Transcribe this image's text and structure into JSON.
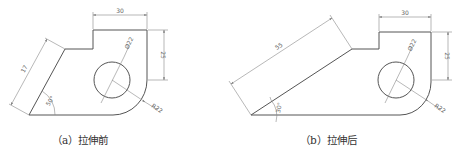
{
  "figures": [
    {
      "id": "a",
      "caption": "（a）拉伸前",
      "dimensions": {
        "top_width": "30",
        "right_height": "25",
        "slant_length": "17",
        "angle": "50°",
        "hole_diameter": "Ø22",
        "fillet_radius": "R22"
      }
    },
    {
      "id": "b",
      "caption": "（b）拉伸后",
      "dimensions": {
        "top_width": "30",
        "right_height": "25",
        "slant_length": "55",
        "angle": "30°",
        "hole_diameter": "Ø22",
        "fillet_radius": "R22"
      }
    }
  ],
  "colors": {
    "outline": "#555555",
    "dimension": "#888888",
    "text": "#333333"
  }
}
